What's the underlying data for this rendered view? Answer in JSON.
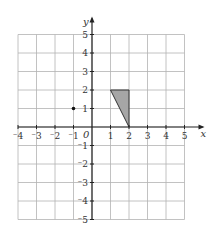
{
  "diagram": {
    "type": "coordinate-grid",
    "x_axis": {
      "label": "x",
      "min": -4,
      "max": 5,
      "ticks": [
        "-4",
        "-3",
        "-2",
        "-1",
        "1",
        "2",
        "3",
        "4",
        "5"
      ]
    },
    "y_axis": {
      "label": "y",
      "min": -5,
      "max": 5,
      "ticks": [
        "5",
        "4",
        "3",
        "2",
        "1",
        "-1",
        "-2",
        "-3",
        "-4",
        "-5"
      ]
    },
    "origin_label": "0",
    "shapes": [
      {
        "type": "triangle",
        "vertices": [
          [
            1,
            2
          ],
          [
            2,
            2
          ],
          [
            2,
            0
          ]
        ],
        "fill": "#a6a6a6",
        "stroke": "#333333"
      }
    ],
    "points": [
      {
        "x": -1,
        "y": 1
      }
    ],
    "colors": {
      "grid": "#b3b3b3",
      "axis": "#222222"
    }
  }
}
